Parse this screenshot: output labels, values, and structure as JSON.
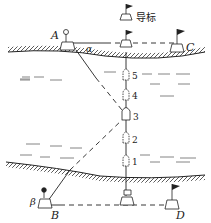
{
  "diagram": {
    "type": "river crossing boat diagram",
    "points": {
      "A": "A",
      "B": "B",
      "C": "C",
      "D": "D"
    },
    "angles": {
      "alpha": "α",
      "beta": "β"
    },
    "beacon_label": "导标",
    "boat_positions": [
      "1",
      "2",
      "3",
      "4",
      "5"
    ],
    "colors": {
      "ink": "#222222",
      "background": "#ffffff"
    }
  }
}
